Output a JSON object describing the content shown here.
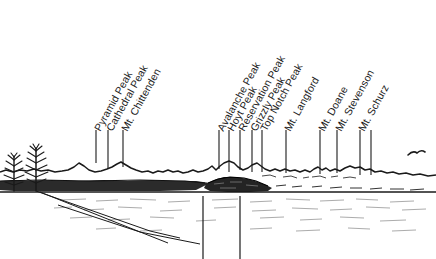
{
  "figure": {
    "kind": "annotated-panorama-illustration",
    "scene_description": "Line-art panorama of a lake shoreline with a distant mountain skyline, two bare conifers at left, a dark timbered island, and a single bird in flight at right",
    "background_color": "#ffffff",
    "ink_color": "#1a1a1a"
  },
  "labels": [
    {
      "text": "Pyramid Peak",
      "x": 96,
      "leader_top": 130,
      "leader_bottom": 163
    },
    {
      "text": "Cathedral Peak",
      "x": 108,
      "leader_top": 130,
      "leader_bottom": 168
    },
    {
      "text": "Mt. Chittenden",
      "x": 123,
      "leader_top": 130,
      "leader_bottom": 167
    },
    {
      "text": "Avalanche Peak",
      "x": 219,
      "leader_top": 130,
      "leader_bottom": 169
    },
    {
      "text": "Hoyt Peak",
      "x": 229,
      "leader_top": 130,
      "leader_bottom": 172
    },
    {
      "text": "Reservation Peak",
      "x": 240,
      "leader_top": 130,
      "leader_bottom": 170
    },
    {
      "text": "Grizzly Peak",
      "x": 252,
      "leader_top": 130,
      "leader_bottom": 172
    },
    {
      "text": "Top Notch Peak",
      "x": 262,
      "leader_top": 130,
      "leader_bottom": 172
    },
    {
      "text": "Mt. Langford",
      "x": 286,
      "leader_top": 130,
      "leader_bottom": 173
    },
    {
      "text": "Mt. Doane",
      "x": 320,
      "leader_top": 130,
      "leader_bottom": 174
    },
    {
      "text": "Mt. Stevenson",
      "x": 337,
      "leader_top": 130,
      "leader_bottom": 173
    },
    {
      "text": "Mt. Schurz",
      "x": 360,
      "leader_top": 130,
      "leader_bottom": 175
    }
  ],
  "extra_labels": [
    {
      "text": "Mt. Schurz-second-leader",
      "x": 371,
      "leader_top": 130,
      "leader_bottom": 175
    }
  ],
  "foreground_markers": [
    {
      "name": "shore-marker-left",
      "x": 203,
      "y_top": 196,
      "y_bottom": 259
    },
    {
      "name": "shore-marker-right",
      "x": 240,
      "y_top": 196,
      "y_bottom": 259
    }
  ],
  "scene_elements": {
    "tree_left": {
      "name": "conifer-tree-left",
      "x": 14,
      "base_y": 190
    },
    "tree_right": {
      "name": "conifer-tree-right",
      "x": 36,
      "base_y": 190
    },
    "bird": {
      "name": "bird-in-flight",
      "x": 416,
      "y": 153
    },
    "island": {
      "name": "dark-timbered-island",
      "x": 215,
      "y": 182
    },
    "waterline_y": 192,
    "skyline_base_y": 176
  }
}
